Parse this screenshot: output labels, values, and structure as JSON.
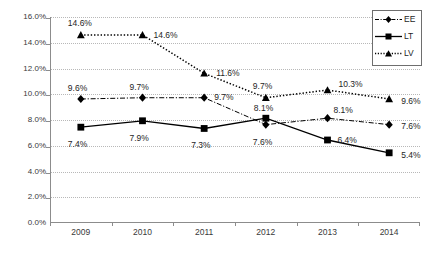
{
  "chart_data": {
    "type": "line",
    "title": "",
    "xlabel": "",
    "ylabel": "",
    "categories": [
      "2009",
      "2010",
      "2011",
      "2012",
      "2013",
      "2014"
    ],
    "ylim": [
      0.0,
      16.0
    ],
    "ytick_step": 2.0,
    "ytick_labels": [
      "0.0%",
      "2.0%",
      "4.0%",
      "6.0%",
      "8.0%",
      "10.0%",
      "12.0%",
      "14.0%",
      "16.0%"
    ],
    "grid": true,
    "grid_style": "dotted-horizontal",
    "legend_position": "top-right",
    "value_suffix": "%",
    "series": [
      {
        "name": "EE",
        "marker": "diamond",
        "line_style": "dash-dot",
        "color": "#000000",
        "values": [
          9.6,
          9.7,
          9.7,
          7.6,
          8.1,
          7.6
        ],
        "labels": [
          "9.6%",
          "9.7%",
          "9.7%",
          "7.6%",
          "8.1%",
          "7.6%"
        ]
      },
      {
        "name": "LT",
        "marker": "square",
        "line_style": "solid",
        "color": "#000000",
        "values": [
          7.4,
          7.9,
          7.3,
          8.1,
          6.4,
          5.4
        ],
        "labels": [
          "7.4%",
          "7.9%",
          "7.3%",
          "8.1%",
          "6.4%",
          "5.4%"
        ]
      },
      {
        "name": "LV",
        "marker": "triangle",
        "line_style": "dotted",
        "color": "#000000",
        "values": [
          14.6,
          14.6,
          11.6,
          9.7,
          10.3,
          9.6
        ],
        "labels": [
          "14.6%",
          "14.6%",
          "11.6%",
          "9.7%",
          "10.3%",
          "9.6%"
        ]
      }
    ]
  },
  "legend": {
    "items": [
      {
        "label": "EE"
      },
      {
        "label": "LT"
      },
      {
        "label": "LV"
      }
    ]
  }
}
